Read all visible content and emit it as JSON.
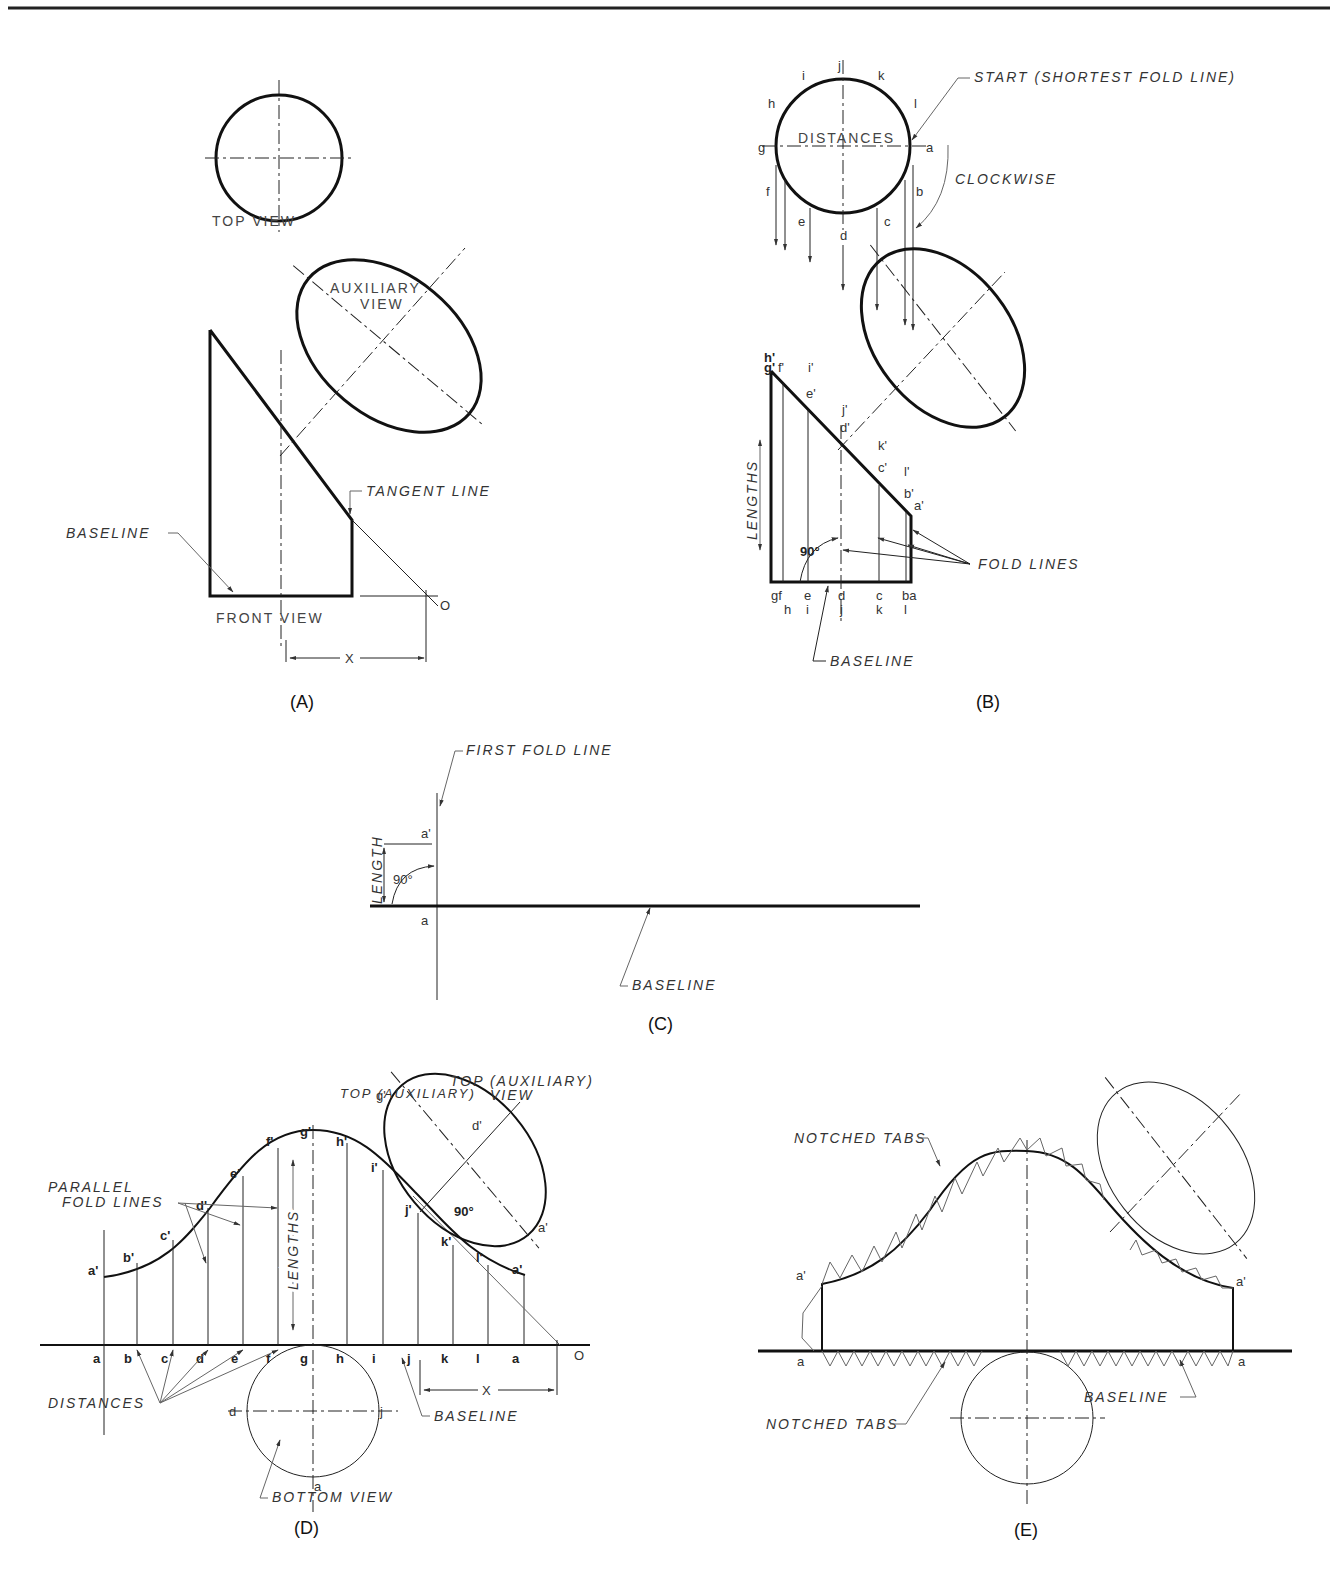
{
  "header": {
    "rule": "top-border-line"
  },
  "panels": {
    "A": {
      "caption": "(A)",
      "top_view": "TOP VIEW",
      "aux_view_line1": "AUXILIARY",
      "aux_view_line2": "VIEW",
      "front_view": "FRONT VIEW",
      "baseline": "BASELINE",
      "tangent_line": "TANGENT LINE",
      "origin": "O",
      "dim": "X"
    },
    "B": {
      "caption": "(B)",
      "start": "START (SHORTEST FOLD LINE)",
      "clockwise": "CLOCKWISE",
      "distances": "DISTANCES",
      "lengths": "LENGTHS",
      "angle": "90°",
      "fold_lines": "FOLD LINES",
      "baseline": "BASELINE",
      "circle_points": [
        "i",
        "j",
        "k",
        "h",
        "l",
        "g",
        "a",
        "f",
        "b",
        "e",
        "c",
        "d"
      ],
      "primed_points": [
        "h'",
        "g'",
        "f'",
        "i'",
        "e'",
        "j'",
        "d'",
        "k'",
        "c'",
        "l'",
        "b'",
        "a'"
      ],
      "base_top_row": [
        "gf",
        "e",
        "d",
        "c",
        "ba"
      ],
      "base_bottom_row": [
        "h",
        "i",
        "j",
        "k",
        "l"
      ]
    },
    "C": {
      "caption": "(C)",
      "first_fold_line": "FIRST FOLD LINE",
      "length": "LENGTH",
      "angle": "90°",
      "top_point": "a'",
      "base_point": "a",
      "baseline": "BASELINE"
    },
    "D": {
      "caption": "(D)",
      "parallel_line1": "PARALLEL",
      "parallel_line2": "FOLD LINES",
      "lengths": "LENGTHS",
      "top_aux_line1": "TOP (AUXILIARY)",
      "top_aux_line2": "VIEW",
      "angle": "90°",
      "distances": "DISTANCES",
      "baseline": "BASELINE",
      "bottom_view": "BOTTOM VIEW",
      "dim": "X",
      "origin": "O",
      "base_points": [
        "a",
        "b",
        "c",
        "d",
        "e",
        "f",
        "g",
        "h",
        "i",
        "j",
        "k",
        "l",
        "a"
      ],
      "curve_points": [
        "a'",
        "b'",
        "c'",
        "d'",
        "e'",
        "f'",
        "g'",
        "h'",
        "i'",
        "j'",
        "k'",
        "l'",
        "a'"
      ],
      "ellipse_points": {
        "g": "g'",
        "d": "d'",
        "a": "a'"
      },
      "circle_points": {
        "d": "d",
        "j": "j",
        "a": "a"
      }
    },
    "E": {
      "caption": "(E)",
      "notched_top": "NOTCHED TABS",
      "notched_bottom": "NOTCHED TABS",
      "baseline": "BASELINE",
      "left_top": "a'",
      "right_top": "a'",
      "left_base": "a",
      "right_base": "a"
    }
  }
}
